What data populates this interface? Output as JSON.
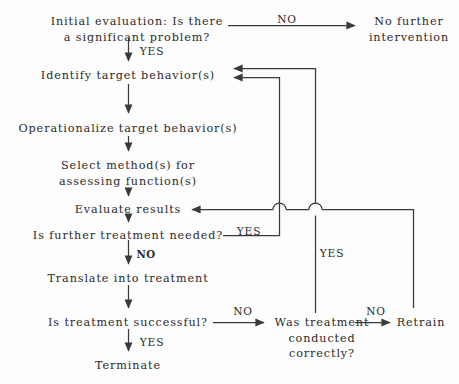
{
  "diagram": {
    "type": "flowchart",
    "background_color": "#fdfdfd",
    "line_color": "#3a3a3a",
    "text_color": "#2a2a2a",
    "nodes": [
      {
        "id": "initial",
        "label": "Initial evaluation: Is there\na significant problem?",
        "x": 137,
        "y": 14
      },
      {
        "id": "nofurther",
        "label": "No further\nintervention",
        "x": 409,
        "y": 14
      },
      {
        "id": "identify",
        "label": "Identify target behavior(s)",
        "x": 128,
        "y": 68
      },
      {
        "id": "operational",
        "label": "Operationalize target behavior(s)",
        "x": 128,
        "y": 121
      },
      {
        "id": "selectmethod",
        "label": "Select method(s) for\nassessing function(s)",
        "x": 128,
        "y": 158
      },
      {
        "id": "evaluate",
        "label": "Evaluate results",
        "x": 128,
        "y": 202
      },
      {
        "id": "furthertx",
        "label": "Is further treatment needed?",
        "x": 128,
        "y": 228
      },
      {
        "id": "translate",
        "label": "Translate into treatment",
        "x": 128,
        "y": 271
      },
      {
        "id": "successful",
        "label": "Is treatment successful?",
        "x": 128,
        "y": 315
      },
      {
        "id": "terminate",
        "label": "Terminate",
        "x": 128,
        "y": 358
      },
      {
        "id": "wastx",
        "label": "Was treatment\nconducted\ncorrectly?",
        "x": 322,
        "y": 315
      },
      {
        "id": "retrain",
        "label": "Retrain",
        "x": 421,
        "y": 315
      }
    ],
    "edge_labels": [
      {
        "id": "no-top",
        "label": "NO",
        "x": 287,
        "y": 13,
        "bold": false
      },
      {
        "id": "yes-initial",
        "label": "YES",
        "x": 152,
        "y": 45,
        "bold": false
      },
      {
        "id": "yes-further",
        "label": "YES",
        "x": 249,
        "y": 225,
        "bold": false
      },
      {
        "id": "no-further",
        "label": "NO",
        "x": 146,
        "y": 248,
        "bold": true
      },
      {
        "id": "yes-wastx",
        "label": "YES",
        "x": 332,
        "y": 247,
        "bold": false
      },
      {
        "id": "no-successful",
        "label": "NO",
        "x": 243,
        "y": 305,
        "bold": false
      },
      {
        "id": "no-wastx",
        "label": "NO",
        "x": 376,
        "y": 305,
        "bold": false
      },
      {
        "id": "yes-terminate",
        "label": "YES",
        "x": 152,
        "y": 336,
        "bold": false
      }
    ]
  }
}
